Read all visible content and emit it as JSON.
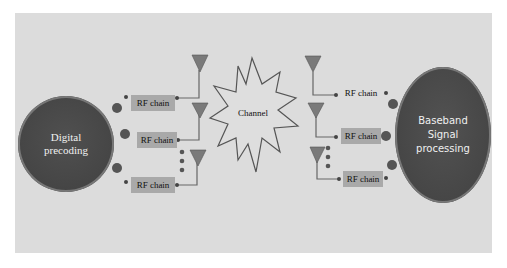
{
  "diagram": {
    "title": "",
    "transmitter": {
      "label_line1": "Digital",
      "label_line2": "precoding",
      "rf_chains": [
        {
          "label": "RF chain"
        },
        {
          "label": "RF chain"
        },
        {
          "label": "RF chain"
        }
      ]
    },
    "channel": {
      "label": "Channel"
    },
    "receiver": {
      "label_line1": "Baseband",
      "label_line2": "Signal",
      "label_line3": "processing",
      "rf_chains": [
        {
          "label": "RF chain"
        },
        {
          "label": "RF chain"
        },
        {
          "label": "RF chain"
        }
      ]
    },
    "colors": {
      "panel": "#dcdcdc",
      "node": "#474747",
      "rf_box": "#a9a9a9",
      "antenna": "#777777",
      "channel_fill": "#dedede",
      "channel_stroke": "#555555"
    }
  }
}
